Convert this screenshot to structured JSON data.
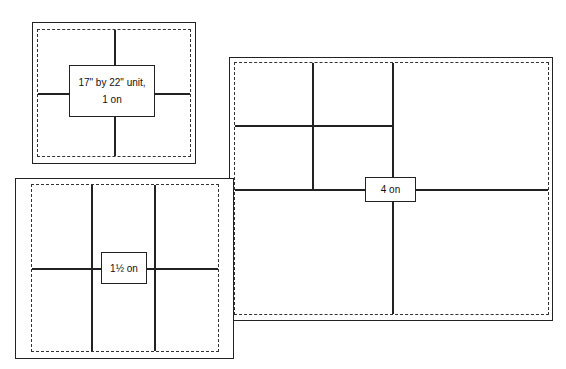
{
  "diagram": {
    "sheets": [
      {
        "id": "one-up",
        "label_line1": "17\" by 22\" unit,",
        "label_line2": "1 on"
      },
      {
        "id": "one-half-up",
        "label": "1½ on"
      },
      {
        "id": "four-up",
        "label": "4 on"
      }
    ]
  }
}
